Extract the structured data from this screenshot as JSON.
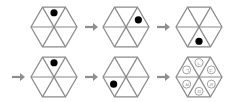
{
  "diagram": {
    "title": "",
    "colors": {
      "lines": "#8a8a8a",
      "arrows": "#8e8e8e",
      "dot": "#000000"
    },
    "rows": [
      {
        "leading_arrow": false,
        "steps": [
          {
            "dot_sector": "top"
          },
          {
            "dot_sector": "top-right"
          },
          {
            "dot_sector": "bottom"
          }
        ]
      },
      {
        "leading_arrow": true,
        "steps": [
          {
            "dot_sector": "top"
          },
          {
            "dot_sector": "bottom-left"
          },
          {
            "dot_sector": null,
            "labels": [
              {
                "sector": "top",
                "text": "ㄴ"
              },
              {
                "sector": "top-right",
                "text": "ㄷ"
              },
              {
                "sector": "bottom-right",
                "text": "ㄹ"
              },
              {
                "sector": "bottom",
                "text": "ㅁ"
              },
              {
                "sector": "bottom-left",
                "text": "ㅂ"
              },
              {
                "sector": "top-left",
                "text": "ㄱ"
              }
            ]
          }
        ]
      }
    ]
  }
}
